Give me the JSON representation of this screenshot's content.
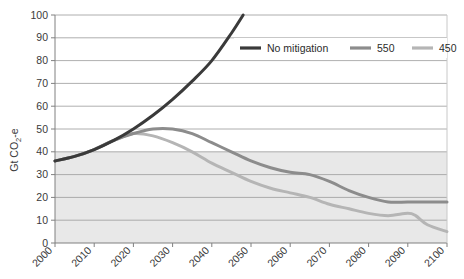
{
  "chart_data": {
    "type": "line",
    "title": "",
    "subtitle": "",
    "xlabel": "",
    "ylabel": "Gt CO2-e",
    "ylabel_parts": {
      "prefix": "Gt CO",
      "sub": "2",
      "suffix": "-e"
    },
    "xlim": [
      2000,
      2100
    ],
    "ylim": [
      0,
      100
    ],
    "x_ticks": [
      "2000",
      "2010",
      "2020",
      "2030",
      "2040",
      "2050",
      "2060",
      "2070",
      "2080",
      "2090",
      "2100"
    ],
    "y_ticks": [
      "0",
      "10",
      "20",
      "30",
      "40",
      "50",
      "60",
      "70",
      "80",
      "90",
      "100"
    ],
    "grid": "horizontal",
    "legend_position": "top-right-inside",
    "shaded_band": {
      "from": 0,
      "to": 40,
      "color": "#e8e8e8",
      "label": ""
    },
    "series": [
      {
        "name": "No mitigation",
        "color": "#3a3a3a",
        "x": [
          2000,
          2005,
          2010,
          2015,
          2020,
          2025,
          2030,
          2035,
          2040,
          2045,
          2048
        ],
        "values": [
          36,
          38,
          41,
          45,
          50,
          56,
          63,
          71,
          80,
          92,
          100
        ]
      },
      {
        "name": "550",
        "color": "#8c8c8c",
        "x": [
          2000,
          2005,
          2010,
          2015,
          2020,
          2025,
          2030,
          2035,
          2040,
          2045,
          2050,
          2055,
          2060,
          2065,
          2070,
          2075,
          2080,
          2085,
          2090,
          2095,
          2100
        ],
        "values": [
          36,
          38,
          41,
          45,
          48,
          50,
          50,
          48,
          44,
          40,
          36,
          33,
          31,
          30,
          27,
          23,
          20,
          18,
          18,
          18,
          18
        ]
      },
      {
        "name": "450",
        "color": "#b5b5b5",
        "x": [
          2000,
          2005,
          2010,
          2015,
          2020,
          2025,
          2030,
          2035,
          2040,
          2045,
          2050,
          2055,
          2060,
          2065,
          2070,
          2075,
          2080,
          2085,
          2090,
          2092,
          2095,
          2100
        ],
        "values": [
          36,
          38,
          41,
          45,
          48,
          47,
          44,
          40,
          35,
          31,
          27,
          24,
          22,
          20,
          17,
          15,
          13,
          12,
          13,
          12,
          8,
          5
        ]
      }
    ]
  },
  "legend": {
    "items": [
      {
        "label": "No mitigation",
        "color": "#3a3a3a"
      },
      {
        "label": "550",
        "color": "#8c8c8c"
      },
      {
        "label": "450",
        "color": "#b5b5b5"
      }
    ]
  }
}
